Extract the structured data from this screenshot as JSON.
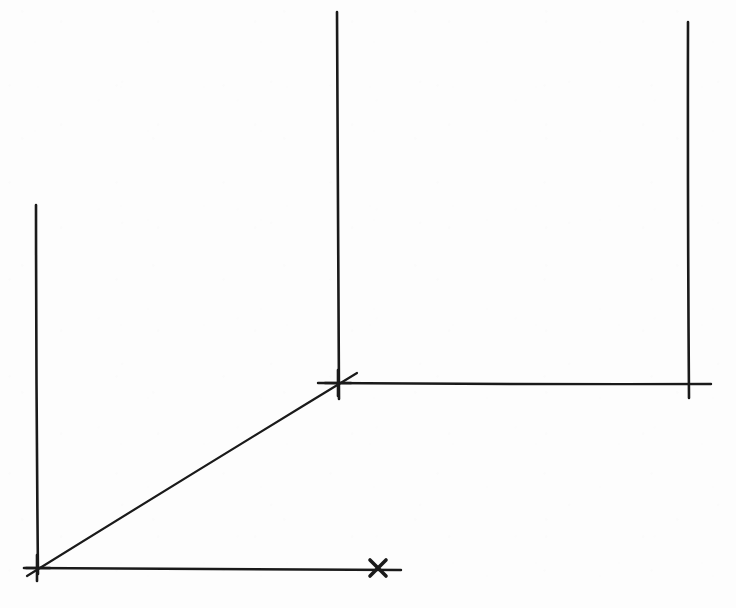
{
  "document": {
    "title": "Hand-drawn stepped axis line diagram",
    "kind": "line-drawing",
    "medium": "ink on paper",
    "width": 736,
    "height": 608,
    "background_color": "#fdfdfd",
    "ink_color": "#1a1a1a",
    "text_labels": [],
    "description": "Three vertical strokes of increasing top height and two horizontal strokes forming a stepped profile, joined at the lower left by a diagonal rising to the middle junction. Small cross marks sit at the origin, the middle junction and one point on the lower horizontal."
  },
  "geometry": {
    "origin": {
      "x": 37,
      "y": 568
    },
    "middle_junction": {
      "x": 338,
      "y": 383
    },
    "right_junction": {
      "x": 688,
      "y": 383
    }
  },
  "strokes": [
    {
      "name": "left-vertical-stroke",
      "role": "left vertical axis",
      "type": "line",
      "x1": 36,
      "y1": 205,
      "x2": 38,
      "y2": 574,
      "width": 2.6
    },
    {
      "name": "middle-vertical-stroke",
      "role": "middle vertical axis",
      "type": "line",
      "x1": 337,
      "y1": 12,
      "x2": 339,
      "y2": 399,
      "width": 2.6
    },
    {
      "name": "right-vertical-stroke",
      "role": "right vertical axis",
      "type": "line",
      "x1": 688,
      "y1": 22,
      "x2": 689,
      "y2": 398,
      "width": 2.6
    },
    {
      "name": "lower-horizontal-stroke",
      "role": "lower horizontal axis from origin",
      "type": "line",
      "x1": 26,
      "y1": 568,
      "x2": 401,
      "y2": 570,
      "width": 2.4
    },
    {
      "name": "upper-horizontal-stroke",
      "role": "upper horizontal axis between middle and right verticals",
      "type": "line",
      "x1": 318,
      "y1": 383,
      "x2": 711,
      "y2": 384,
      "width": 2.4
    },
    {
      "name": "diagonal-stroke",
      "role": "diagonal rising from origin to middle junction",
      "type": "line",
      "x1": 27,
      "y1": 576,
      "x2": 357,
      "y2": 373,
      "width": 2.2
    }
  ],
  "marks": [
    {
      "name": "origin-cross-mark",
      "role": "cross tick at origin",
      "cx": 37,
      "cy": 568,
      "arm": 13,
      "width": 2.6,
      "style": "plus"
    },
    {
      "name": "junction-cross-mark",
      "role": "cross tick at middle junction",
      "cx": 338,
      "cy": 383,
      "arm": 13,
      "width": 2.6,
      "style": "plus"
    },
    {
      "name": "axis-x-tick-mark",
      "role": "x-shaped tick on lower horizontal axis",
      "cx": 378,
      "cy": 568,
      "arm": 8,
      "width": 3.6,
      "style": "x"
    }
  ]
}
